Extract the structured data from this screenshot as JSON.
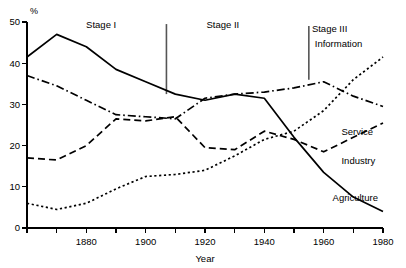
{
  "chart_data": {
    "type": "line",
    "title": "",
    "xlabel": "Year",
    "ylabel": "%",
    "ylim": [
      0,
      50
    ],
    "xlim": [
      1860,
      1980
    ],
    "grid": false,
    "legend_position": "inline-right",
    "y_ticks": [
      0,
      10,
      20,
      30,
      40,
      50
    ],
    "y_tick_labels": [
      "0",
      "10",
      "20",
      "30",
      "40",
      "50"
    ],
    "x_ticks": [
      1860,
      1870,
      1880,
      1890,
      1900,
      1910,
      1920,
      1930,
      1940,
      1950,
      1960,
      1970,
      1980
    ],
    "x_tick_labels": [
      "1880",
      "1900",
      "1920",
      "1940",
      "1960",
      "1980"
    ],
    "x_labelled_ticks": [
      1880,
      1900,
      1920,
      1940,
      1960,
      1980
    ],
    "annotations": [
      {
        "name": "stage-1",
        "text": "Stage I",
        "x": 1885,
        "y": 48.5
      },
      {
        "name": "stage-2",
        "text": "Stage II",
        "x": 1926,
        "y": 48.5
      },
      {
        "name": "stage-3",
        "text": "Stage III",
        "x": 1962,
        "y": 47.5
      }
    ],
    "dividers": [
      {
        "name": "stage-1-2-divider",
        "x": 1907,
        "y_top": 49.5,
        "y_bottom": 32.5
      },
      {
        "name": "stage-2-3-divider",
        "x": 1955,
        "y_top": 49.0,
        "y_bottom": 36.0
      }
    ],
    "x": [
      1860,
      1870,
      1880,
      1890,
      1900,
      1910,
      1920,
      1930,
      1940,
      1950,
      1960,
      1970,
      1980
    ],
    "series": [
      {
        "name": "Agriculture",
        "style": "solid",
        "label": "Agriculture",
        "label_x": 1963,
        "label_y": 6.6,
        "values": [
          41.5,
          47.0,
          44.0,
          38.5,
          35.5,
          32.5,
          31.0,
          32.5,
          31.5,
          22.0,
          13.5,
          7.5,
          4.0
        ]
      },
      {
        "name": "Industry",
        "style": "dashed",
        "label": "Industry",
        "label_x": 1966,
        "label_y": 15.5,
        "values": [
          17.0,
          16.5,
          20.0,
          26.5,
          26.0,
          27.0,
          19.5,
          19.0,
          23.5,
          21.5,
          18.5,
          22.0,
          25.5
        ]
      },
      {
        "name": "Service",
        "style": "dashdot",
        "label": "Service",
        "label_x": 1966,
        "label_y": 22.5,
        "values": [
          37.0,
          34.5,
          31.0,
          27.5,
          27.0,
          26.5,
          31.5,
          32.5,
          33.0,
          34.0,
          35.5,
          32.0,
          29.5
        ]
      },
      {
        "name": "Information",
        "style": "dotted",
        "label": "Information",
        "label_x": 1957,
        "label_y": 44.0,
        "values": [
          6.0,
          4.5,
          6.0,
          9.5,
          12.5,
          13.0,
          14.0,
          17.5,
          21.5,
          23.5,
          28.5,
          36.0,
          41.5
        ]
      }
    ]
  }
}
